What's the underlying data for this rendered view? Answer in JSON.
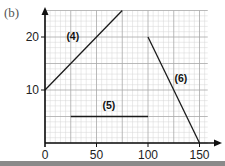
{
  "part_label": "(b)",
  "chart_data": {
    "type": "line",
    "title": "",
    "xlabel": "",
    "ylabel": "",
    "xlim": [
      0,
      160
    ],
    "ylim": [
      0,
      25
    ],
    "grid": true,
    "x_ticks": [
      0,
      50,
      100,
      150
    ],
    "y_ticks": [
      10,
      20
    ],
    "x_tick_labels": [
      "0",
      "50",
      "100",
      "150"
    ],
    "y_tick_labels": [
      "10",
      "20"
    ],
    "series": [
      {
        "name": "(4)",
        "x": [
          0,
          75
        ],
        "y": [
          10,
          25
        ]
      },
      {
        "name": "(5)",
        "x": [
          25,
          100
        ],
        "y": [
          5,
          5
        ]
      },
      {
        "name": "(6)",
        "x": [
          100,
          150
        ],
        "y": [
          20,
          0
        ]
      }
    ],
    "annotations": [
      {
        "text": "(4)",
        "x": 27,
        "y": 19.5
      },
      {
        "text": "(5)",
        "x": 62,
        "y": 6.5
      },
      {
        "text": "(6)",
        "x": 132,
        "y": 11.5
      }
    ]
  },
  "colors": {
    "grid_minor": "#d6d6d6",
    "grid_major": "#a8a8a8",
    "line": "#1a1a1a",
    "axis": "#111111"
  }
}
